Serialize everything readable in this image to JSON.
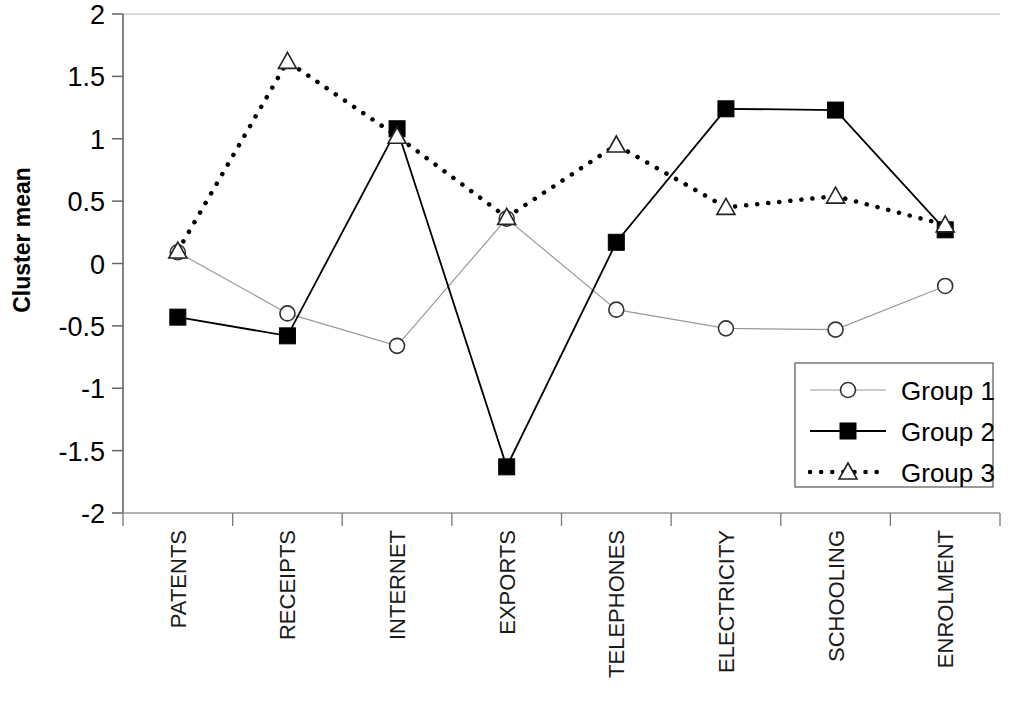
{
  "chart_data": {
    "type": "line",
    "title": "",
    "xlabel": "",
    "ylabel": "Cluster mean",
    "ylim": [
      -2,
      2
    ],
    "ytick_labels": [
      "2",
      "1.5",
      "1",
      "0.5",
      "0",
      "-0.5",
      "-1",
      "-1.5",
      "-2"
    ],
    "ytick_values": [
      2,
      1.5,
      1,
      0.5,
      0,
      -0.5,
      -1,
      -1.5,
      -2
    ],
    "grid": false,
    "legend_position": "bottom-right",
    "categories": [
      "PATENTS",
      "RECEIPTS",
      "INTERNET",
      "EXPORTS",
      "TELEPHONES",
      "ELECTRICITY",
      "SCHOOLING",
      "ENROLMENT"
    ],
    "series": [
      {
        "name": "Group 1",
        "marker": "open-circle",
        "line_style": "solid-thin",
        "color": "#999999",
        "values": [
          0.09,
          -0.4,
          -0.66,
          0.36,
          -0.37,
          -0.52,
          -0.53,
          -0.18
        ]
      },
      {
        "name": "Group 2",
        "marker": "filled-square",
        "line_style": "solid",
        "color": "#000000",
        "values": [
          -0.43,
          -0.58,
          1.08,
          -1.63,
          0.17,
          1.24,
          1.23,
          0.27
        ]
      },
      {
        "name": "Group 3",
        "marker": "open-triangle",
        "line_style": "dotted",
        "color": "#000000",
        "values": [
          0.1,
          1.62,
          1.02,
          0.37,
          0.95,
          0.45,
          0.54,
          0.31
        ]
      }
    ]
  },
  "legend": {
    "items": [
      {
        "label": "Group 1"
      },
      {
        "label": "Group 2"
      },
      {
        "label": "Group 3"
      }
    ]
  }
}
